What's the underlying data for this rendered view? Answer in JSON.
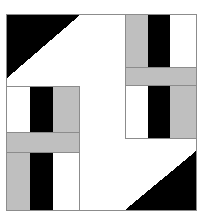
{
  "artwork": {
    "title": "Geometric Block Composition",
    "canvas": {
      "width": 205,
      "height": 217,
      "background": "#ffffff"
    },
    "frame": {
      "name": "outer-frame",
      "x": 6,
      "y": 14,
      "width": 191,
      "height": 197,
      "stroke": "#8c8c8c",
      "stroke_width": 1,
      "fill": "#ffffff"
    },
    "palette": {
      "black": "#000000",
      "gray": "#bfbfbf",
      "white": "#ffffff",
      "hairline": "#8c8c8c"
    },
    "shapes": [
      {
        "name": "top-left-black-triangle",
        "kind": "triangle",
        "points": "7,15 80,15 7,78",
        "fill": "#000000",
        "description": "black right triangle filling the upper-left corner, hypotenuse descending left"
      },
      {
        "name": "bottom-right-black-triangle",
        "kind": "triangle",
        "points": "196,151 196,210 125,210",
        "fill": "#000000",
        "description": "black right triangle filling the lower-right corner"
      },
      {
        "name": "top-right-block-gray-bar",
        "kind": "rect",
        "x": 126,
        "y": 15,
        "width": 22,
        "height": 53,
        "fill": "#bfbfbf"
      },
      {
        "name": "top-right-block-black-bar",
        "kind": "rect",
        "x": 148,
        "y": 15,
        "width": 22,
        "height": 53,
        "fill": "#000000"
      },
      {
        "name": "top-right-block-white-bar",
        "kind": "rect",
        "x": 170,
        "y": 15,
        "width": 26,
        "height": 53,
        "fill": "#ffffff"
      },
      {
        "name": "top-right-horizontal-gray-band",
        "kind": "rect",
        "x": 126,
        "y": 68,
        "width": 70,
        "height": 18,
        "fill": "#bfbfbf"
      },
      {
        "name": "top-right-band-black-overlap",
        "kind": "rect",
        "x": 148,
        "y": 86,
        "width": 22,
        "height": 4,
        "fill": "#000000"
      },
      {
        "name": "mid-right-block-white-bar",
        "kind": "rect",
        "x": 126,
        "y": 86,
        "width": 22,
        "height": 52,
        "fill": "#ffffff"
      },
      {
        "name": "mid-right-block-black-bar",
        "kind": "rect",
        "x": 148,
        "y": 86,
        "width": 22,
        "height": 52,
        "fill": "#000000"
      },
      {
        "name": "mid-right-block-gray-bar",
        "kind": "rect",
        "x": 170,
        "y": 86,
        "width": 26,
        "height": 52,
        "fill": "#bfbfbf"
      },
      {
        "name": "mid-left-block-white-bar",
        "kind": "rect",
        "x": 7,
        "y": 87,
        "width": 23,
        "height": 46,
        "fill": "#ffffff"
      },
      {
        "name": "mid-left-block-black-bar",
        "kind": "rect",
        "x": 30,
        "y": 87,
        "width": 23,
        "height": 46,
        "fill": "#000000"
      },
      {
        "name": "mid-left-block-gray-bar",
        "kind": "rect",
        "x": 53,
        "y": 87,
        "width": 26,
        "height": 46,
        "fill": "#bfbfbf"
      },
      {
        "name": "left-horizontal-gray-band",
        "kind": "rect",
        "x": 7,
        "y": 133,
        "width": 72,
        "height": 20,
        "fill": "#bfbfbf"
      },
      {
        "name": "bottom-left-block-gray-bar",
        "kind": "rect",
        "x": 7,
        "y": 153,
        "width": 23,
        "height": 57,
        "fill": "#bfbfbf"
      },
      {
        "name": "bottom-left-block-black-bar",
        "kind": "rect",
        "x": 30,
        "y": 153,
        "width": 23,
        "height": 57,
        "fill": "#000000"
      },
      {
        "name": "bottom-left-block-white-bar",
        "kind": "rect",
        "x": 53,
        "y": 153,
        "width": 26,
        "height": 57,
        "fill": "#ffffff"
      }
    ],
    "hairlines": [
      {
        "name": "hairline-mid-left-block-top",
        "x": 7,
        "y": 86,
        "width": 73,
        "height": 1
      },
      {
        "name": "hairline-mid-left-block-right",
        "x": 79,
        "y": 86,
        "width": 1,
        "height": 124
      },
      {
        "name": "hairline-left-band-top",
        "x": 7,
        "y": 132,
        "width": 73,
        "height": 1
      },
      {
        "name": "hairline-left-band-bottom",
        "x": 7,
        "y": 152,
        "width": 73,
        "height": 1
      },
      {
        "name": "hairline-top-right-block-left",
        "x": 125,
        "y": 15,
        "width": 1,
        "height": 123
      },
      {
        "name": "hairline-top-right-band-top",
        "x": 125,
        "y": 67,
        "width": 72,
        "height": 1
      },
      {
        "name": "hairline-top-right-band-bottom",
        "x": 125,
        "y": 85,
        "width": 72,
        "height": 1
      },
      {
        "name": "hairline-mid-right-block-bottom",
        "x": 125,
        "y": 138,
        "width": 72,
        "height": 1
      }
    ]
  }
}
